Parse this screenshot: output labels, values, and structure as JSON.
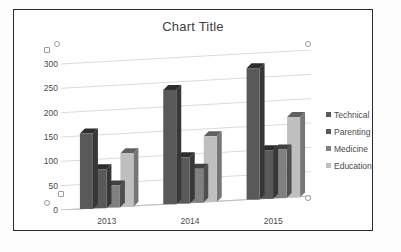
{
  "chart_data": {
    "type": "bar",
    "title": "Chart Title",
    "xlabel": "",
    "ylabel": "",
    "categories": [
      "2013",
      "2014",
      "2015"
    ],
    "series": [
      {
        "name": "Technical",
        "values": [
          155,
          235,
          270
        ],
        "color": "#595959"
      },
      {
        "name": "Parenting",
        "values": [
          80,
          95,
          100
        ],
        "color": "#595959"
      },
      {
        "name": "Medicine",
        "values": [
          45,
          70,
          100
        ],
        "color": "#808080"
      },
      {
        "name": "Education",
        "values": [
          110,
          135,
          165
        ],
        "color": "#bfbfbf"
      }
    ],
    "ylim": [
      0,
      300
    ],
    "yticks": [
      0,
      50,
      100,
      150,
      200,
      250,
      300
    ],
    "grid": true,
    "legend_position": "right",
    "threed": true
  },
  "selection": {
    "handles": [
      "top-left",
      "top-right",
      "bottom-left",
      "bottom-right",
      "left-mid",
      "right-mid"
    ]
  }
}
